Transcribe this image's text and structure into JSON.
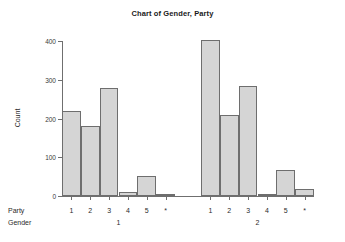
{
  "chart_data": {
    "type": "bar",
    "title": "Chart of Gender, Party",
    "xlabel": "Party",
    "ylabel": "Count",
    "ylim": [
      0,
      400
    ],
    "yticks": [
      0,
      100,
      200,
      300,
      400
    ],
    "grid": false,
    "legend": null,
    "group_axis_label": "Gender",
    "categories": [
      "1",
      "2",
      "3",
      "4",
      "5",
      "*"
    ],
    "groups": [
      {
        "name": "1",
        "values": [
          220,
          180,
          280,
          10,
          52,
          5
        ]
      },
      {
        "name": "2",
        "values": [
          403,
          210,
          285,
          6,
          66,
          18
        ]
      }
    ],
    "bar_fill": "#d5d5d5",
    "bar_edge": "#6e6e6e",
    "axis_color": "#6f6f6f"
  },
  "axis": {
    "y_label": "Count",
    "y_ticks": [
      "0",
      "100",
      "200",
      "300",
      "400"
    ],
    "row_label_party": "Party",
    "row_label_gender": "Gender"
  },
  "title": "Chart of Gender, Party"
}
